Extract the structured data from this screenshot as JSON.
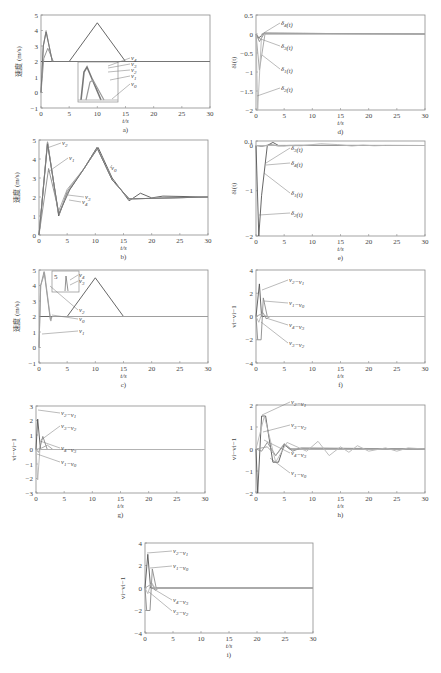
{
  "chart_data": [
    {
      "id": "a",
      "caption": "a)",
      "type": "line",
      "xlabel": "t/s",
      "ylabel": "速度 (m/s)",
      "xlim": [
        0,
        30
      ],
      "ylim": [
        -1,
        5
      ],
      "xticks": [
        0,
        5,
        10,
        15,
        20,
        25,
        30
      ],
      "yticks": [
        -1,
        0,
        1,
        2,
        3,
        4,
        5
      ],
      "legend": [
        "v4",
        "v3",
        "v2",
        "v1",
        "v0"
      ],
      "inset": true,
      "series": [
        {
          "name": "v0",
          "x": [
            0,
            5,
            10,
            15,
            30
          ],
          "y": [
            2,
            2,
            4.5,
            2,
            2
          ]
        },
        {
          "name": "v1",
          "x": [
            0,
            0.5,
            1.2,
            2.2,
            30
          ],
          "y": [
            0,
            2.2,
            2.85,
            2.0,
            2.0
          ]
        },
        {
          "name": "v2",
          "x": [
            0,
            0.4,
            0.9,
            2.0,
            30
          ],
          "y": [
            0,
            3,
            4,
            2,
            2
          ]
        },
        {
          "name": "v3",
          "x": [
            0,
            0.4,
            0.9,
            2.0,
            30
          ],
          "y": [
            0,
            3,
            3.95,
            2,
            2
          ]
        },
        {
          "name": "v4",
          "x": [
            0,
            0.4,
            0.9,
            2.0,
            30
          ],
          "y": [
            0,
            3,
            3.9,
            2,
            2
          ]
        }
      ]
    },
    {
      "id": "d",
      "caption": "d)",
      "type": "line",
      "xlabel": "t/s",
      "ylabel": "δi(t)",
      "xlim": [
        0,
        30
      ],
      "ylim": [
        -2,
        0.5
      ],
      "xticks": [
        0,
        5,
        10,
        15,
        20,
        25,
        30
      ],
      "yticks": [
        -2,
        -1.5,
        -1,
        -0.5,
        0,
        0.5
      ],
      "legend": [
        "δ4(t)",
        "δ3(t)",
        "δ1(t)",
        "δ2(t)"
      ],
      "series": [
        {
          "name": "δ4(t)",
          "x": [
            0,
            0.5,
            1.5,
            30
          ],
          "y": [
            0,
            -0.1,
            0.02,
            0
          ]
        },
        {
          "name": "δ3(t)",
          "x": [
            0,
            0.6,
            1.5,
            30
          ],
          "y": [
            0,
            -0.2,
            0.02,
            0
          ]
        },
        {
          "name": "δ1(t)",
          "x": [
            0,
            0.6,
            1.6,
            30
          ],
          "y": [
            0,
            -0.95,
            0,
            0
          ]
        },
        {
          "name": "δ2(t)",
          "x": [
            0,
            0.3,
            1.0,
            30
          ],
          "y": [
            0,
            -2.0,
            0,
            0
          ]
        }
      ]
    },
    {
      "id": "b",
      "caption": "b)",
      "type": "line",
      "xlabel": "t/s",
      "ylabel": "速度 (m/s)",
      "xlim": [
        0,
        30
      ],
      "ylim": [
        0,
        5
      ],
      "xticks": [
        0,
        5,
        10,
        15,
        20,
        25,
        30
      ],
      "yticks": [
        0,
        1,
        2,
        3,
        4,
        5
      ],
      "legend": [
        "v2",
        "v1",
        "v0",
        "v3",
        "v4"
      ],
      "series": [
        {
          "name": "v0",
          "x": [
            0,
            1.5,
            3.5,
            5,
            8,
            10.5,
            13,
            16,
            18,
            20,
            22,
            30
          ],
          "y": [
            0,
            4.9,
            1.0,
            2.2,
            3.5,
            4.6,
            3.0,
            1.8,
            2.2,
            1.95,
            2.05,
            2
          ]
        },
        {
          "name": "v1",
          "x": [
            0,
            1.7,
            3.6,
            5,
            8,
            10.3,
            13,
            16,
            30
          ],
          "y": [
            0,
            3.5,
            1.1,
            2.3,
            3.5,
            4.6,
            2.9,
            1.9,
            2
          ]
        },
        {
          "name": "v2",
          "x": [
            0,
            1.5,
            3.4,
            5,
            8,
            10.3,
            13,
            16,
            30
          ],
          "y": [
            0,
            4.9,
            1.2,
            2.4,
            3.5,
            4.6,
            2.9,
            1.9,
            2
          ]
        },
        {
          "name": "v3",
          "x": [
            0,
            1.5,
            3.5,
            5.5,
            8,
            10.3,
            13,
            16,
            30
          ],
          "y": [
            0,
            4.8,
            1.1,
            2.5,
            3.5,
            4.6,
            2.9,
            1.9,
            2
          ]
        },
        {
          "name": "v4",
          "x": [
            0,
            1.5,
            3.5,
            5.5,
            8,
            10.3,
            13,
            16,
            30
          ],
          "y": [
            0,
            4.8,
            1.1,
            2.4,
            3.5,
            4.6,
            2.9,
            1.9,
            2
          ]
        }
      ]
    },
    {
      "id": "e",
      "caption": "e)",
      "type": "line",
      "xlabel": "t/s",
      "ylabel": "δi(t)",
      "xlim": [
        0,
        30
      ],
      "ylim": [
        -2,
        0.1
      ],
      "xticks": [
        0,
        5,
        10,
        15,
        20,
        25,
        30
      ],
      "yticks": [
        -2,
        -1,
        0,
        0.1
      ],
      "legend": [
        "δ3(t)",
        "δ4(t)",
        "δ1(t)",
        "δ2(t)"
      ],
      "series": [
        {
          "name": "δ2(t)",
          "x": [
            0,
            0.5,
            1.0,
            2.0,
            3.0,
            4.0,
            30
          ],
          "y": [
            0,
            -2.0,
            -1.1,
            0,
            0.07,
            0,
            0
          ]
        },
        {
          "name": "δ3(t)",
          "x": [
            0,
            1,
            2.5,
            4,
            6,
            30
          ],
          "y": [
            0,
            -0.02,
            0.02,
            -0.01,
            0.005,
            0
          ]
        },
        {
          "name": "δ4(t)",
          "x": [
            0,
            1,
            3,
            5,
            7,
            30
          ],
          "y": [
            0,
            -0.01,
            0.01,
            -0.01,
            0.005,
            0
          ]
        },
        {
          "name": "δ1(t)",
          "x": [
            0,
            2,
            5,
            8,
            11.5,
            14.5,
            17,
            19,
            21,
            23,
            30
          ],
          "y": [
            0,
            0,
            0.005,
            -0.005,
            0.04,
            0.02,
            -0.01,
            0.01,
            -0.005,
            0.002,
            0
          ]
        }
      ]
    },
    {
      "id": "c",
      "caption": "c)",
      "type": "line",
      "xlabel": "t/s",
      "ylabel": "速度 (m/s)",
      "xlim": [
        0,
        30
      ],
      "ylim": [
        -1,
        5
      ],
      "xticks": [
        0,
        5,
        10,
        15,
        20,
        25,
        30
      ],
      "yticks": [
        -1,
        0,
        1,
        2,
        3,
        4,
        5
      ],
      "legend": [
        "v4",
        "v3",
        "v2",
        "v0",
        "v1"
      ],
      "inset": true,
      "inset_label": "5",
      "series": [
        {
          "name": "v0",
          "x": [
            0,
            5,
            10,
            15,
            30
          ],
          "y": [
            2,
            2,
            4.5,
            2,
            2
          ]
        },
        {
          "name": "v1",
          "x": [
            0,
            0.3,
            0.9,
            2.0,
            2.3,
            30
          ],
          "y": [
            0,
            4.0,
            4.9,
            1.8,
            2.0,
            2.0
          ]
        },
        {
          "name": "v2",
          "x": [
            0,
            0.3,
            1.0,
            2.1,
            2.3,
            30
          ],
          "y": [
            0,
            4.0,
            4.8,
            1.7,
            2.0,
            2.0
          ]
        }
      ]
    },
    {
      "id": "f",
      "caption": "f)",
      "type": "line",
      "xlabel": "t/s",
      "ylabel": "vi−vi−1",
      "xlim": [
        0,
        30
      ],
      "ylim": [
        -4,
        4
      ],
      "xticks": [
        0,
        5,
        10,
        15,
        20,
        25,
        30
      ],
      "yticks": [
        -4,
        -2,
        0,
        2,
        4
      ],
      "legend": [
        "v2−v1",
        "v1−v0",
        "v4−v3",
        "v3−v2"
      ],
      "series": [
        {
          "name": "v2−v1",
          "x": [
            0,
            0.6,
            1.0,
            1.5,
            30
          ],
          "y": [
            0,
            2.8,
            0,
            0,
            0
          ]
        },
        {
          "name": "v1−v0",
          "x": [
            0,
            0.3,
            0.9,
            1.3,
            2.0,
            30
          ],
          "y": [
            0,
            -2.0,
            -2.0,
            1.6,
            0,
            0
          ]
        },
        {
          "name": "v4−v3",
          "x": [
            0,
            1.3,
            1.8,
            2.5,
            30
          ],
          "y": [
            0,
            0.3,
            -0.2,
            0,
            0
          ]
        },
        {
          "name": "v3−v2",
          "x": [
            0,
            0.5,
            1.0,
            2.0,
            30
          ],
          "y": [
            0,
            -0.5,
            0.2,
            0,
            0
          ]
        }
      ]
    },
    {
      "id": "g",
      "caption": "g)",
      "type": "line",
      "xlabel": "t/s",
      "ylabel": "vi−vi−1",
      "xlim": [
        0,
        30
      ],
      "ylim": [
        -3,
        3
      ],
      "xticks": [
        0,
        5,
        10,
        15,
        20,
        25,
        30
      ],
      "yticks": [
        -3,
        -2,
        -1,
        0,
        1,
        2,
        3
      ],
      "legend": [
        "v2−v1",
        "v3−v2",
        "v4−v3",
        "v1−v0"
      ],
      "series": [
        {
          "name": "v2−v1",
          "x": [
            0,
            0.3,
            0.8,
            30
          ],
          "y": [
            0,
            2.1,
            0,
            0
          ]
        },
        {
          "name": "v3−v2",
          "x": [
            0,
            0.5,
            1.2,
            2.0,
            30
          ],
          "y": [
            0,
            -0.2,
            0.9,
            0,
            0
          ]
        },
        {
          "name": "v4−v3",
          "x": [
            0,
            1.0,
            2.0,
            3.0,
            30
          ],
          "y": [
            0,
            0.1,
            0.3,
            0,
            0
          ]
        },
        {
          "name": "v1−v0",
          "x": [
            0,
            0.3,
            0.7,
            30
          ],
          "y": [
            0,
            -2.1,
            0,
            0
          ]
        }
      ]
    },
    {
      "id": "h",
      "caption": "h)",
      "type": "line",
      "xlabel": "t/s",
      "ylabel": "vi−vi−1",
      "xlim": [
        0,
        30
      ],
      "ylim": [
        -2,
        2
      ],
      "xticks": [
        0,
        5,
        10,
        15,
        20,
        25,
        30
      ],
      "yticks": [
        -2,
        -1,
        0,
        1,
        2
      ],
      "legend": [
        "v2−v1",
        "v3−v2",
        "v4−v3",
        "v1−v0"
      ],
      "series": [
        {
          "name": "v2−v1",
          "x": [
            0,
            0.3,
            1.0,
            1.7,
            3.0,
            4.0,
            5.0,
            6.0,
            30
          ],
          "y": [
            0,
            -2.0,
            1.5,
            1.5,
            -0.6,
            -0.6,
            0.2,
            0,
            0
          ]
        },
        {
          "name": "v3−v2",
          "x": [
            0,
            1.0,
            2.0,
            3.5,
            5.0,
            6.5,
            8,
            30
          ],
          "y": [
            0,
            -0.1,
            0.3,
            -0.3,
            0.2,
            -0.1,
            0.05,
            0
          ]
        },
        {
          "name": "v4−v3",
          "x": [
            0,
            2,
            3.5,
            5,
            6.5,
            8,
            30
          ],
          "y": [
            0,
            0.1,
            -0.3,
            0.25,
            -0.05,
            0.02,
            0
          ]
        },
        {
          "name": "v1−v0",
          "x": [
            0,
            1.5,
            3.5,
            5.5,
            9,
            11,
            13,
            15,
            16.5,
            18,
            20,
            23,
            25,
            27,
            30
          ],
          "y": [
            0,
            1.5,
            -0.6,
            0.3,
            -0.1,
            0.35,
            -0.3,
            0.1,
            -0.15,
            0.15,
            -0.1,
            0.05,
            -0.1,
            0.05,
            0
          ]
        }
      ]
    },
    {
      "id": "i",
      "caption": "i)",
      "type": "line",
      "xlabel": "t/s",
      "ylabel": "vi−vi−1",
      "xlim": [
        0,
        30
      ],
      "ylim": [
        -4,
        4
      ],
      "xticks": [
        0,
        5,
        10,
        15,
        20,
        25,
        30
      ],
      "yticks": [
        -4,
        -2,
        0,
        2,
        4
      ],
      "legend": [
        "v2−v1",
        "v1−v0",
        "v4−v3",
        "v3−v2"
      ],
      "series": [
        {
          "name": "v2−v1",
          "x": [
            0,
            0.5,
            1.0,
            1.5,
            30
          ],
          "y": [
            0,
            3.0,
            0,
            0,
            0
          ]
        },
        {
          "name": "v1−v0",
          "x": [
            0,
            0.3,
            0.9,
            1.3,
            2.0,
            30
          ],
          "y": [
            0,
            -2.0,
            -2.0,
            1.7,
            0,
            0
          ]
        },
        {
          "name": "v4−v3",
          "x": [
            0,
            1.3,
            1.8,
            2.5,
            30
          ],
          "y": [
            0,
            0.4,
            -0.2,
            0,
            0
          ]
        },
        {
          "name": "v3−v2",
          "x": [
            0,
            0.5,
            1.0,
            2.0,
            30
          ],
          "y": [
            0,
            -0.5,
            0.3,
            0,
            0
          ]
        }
      ]
    }
  ],
  "layout": {
    "a": {
      "x0": 41,
      "x1": 210,
      "y0": 15,
      "y1": 108
    },
    "d": {
      "x0": 256,
      "x1": 425,
      "y0": 15,
      "y1": 110
    },
    "b": {
      "x0": 39,
      "x1": 208,
      "y0": 140,
      "y1": 235
    },
    "e": {
      "x0": 256,
      "x1": 425,
      "y0": 141,
      "y1": 236
    },
    "c": {
      "x0": 39,
      "x1": 208,
      "y0": 270,
      "y1": 363
    },
    "f": {
      "x0": 256,
      "x1": 425,
      "y0": 270,
      "y1": 363
    },
    "g": {
      "x0": 36,
      "x1": 205,
      "y0": 406,
      "y1": 493
    },
    "h": {
      "x0": 256,
      "x1": 425,
      "y0": 405,
      "y1": 493
    },
    "i": {
      "x0": 145,
      "x1": 313,
      "y0": 543,
      "y1": 633
    }
  },
  "colors": {
    "axis": "#888888",
    "line_dark": "#555555",
    "line_mid": "#8a8a8a",
    "line_light": "#b5b5b5"
  }
}
